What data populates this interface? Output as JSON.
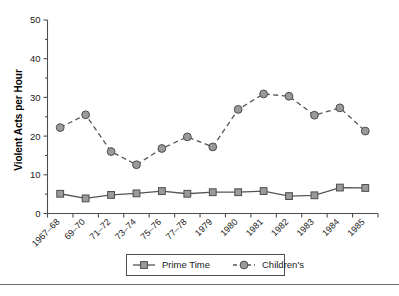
{
  "chart_data": {
    "type": "line",
    "title": "",
    "xlabel": "",
    "ylabel": "Violent Acts per Hour",
    "ylim": [
      0,
      50
    ],
    "yticks": [
      0,
      10,
      20,
      30,
      40,
      50
    ],
    "ytick_labels": [
      "0",
      "10",
      "20",
      "30",
      "40",
      "50"
    ],
    "minor_ytick_step": 5,
    "grid": false,
    "legend_position": "bottom-center",
    "categories": [
      "1967–68",
      "69–70",
      "71–72",
      "73–74",
      "75–76",
      "77–78",
      "1979",
      "1980",
      "1981",
      "1982",
      "1983",
      "1984",
      "1985"
    ],
    "series": [
      {
        "name": "Prime Time",
        "marker": "square",
        "linestyle": "solid",
        "color": "#555555",
        "marker_fill": "#9a9a9a",
        "values": [
          5.1,
          3.9,
          4.8,
          5.2,
          5.8,
          5.1,
          5.5,
          5.5,
          5.8,
          4.5,
          4.7,
          6.7,
          6.6
        ]
      },
      {
        "name": "Children's",
        "marker": "circle",
        "linestyle": "dashed",
        "color": "#555555",
        "marker_fill": "#9a9a9a",
        "values": [
          22.2,
          25.5,
          16.0,
          12.6,
          16.8,
          19.8,
          17.2,
          26.9,
          30.9,
          30.3,
          25.4,
          27.3,
          21.3
        ]
      }
    ]
  },
  "legend": {
    "entries": [
      {
        "label": "Prime Time",
        "marker": "square-marker",
        "linestyle": "solid"
      },
      {
        "label": "Children's",
        "marker": "circle-marker",
        "linestyle": "dashed"
      }
    ]
  },
  "colors": {
    "line": "#555555",
    "marker_fill": "#9a9a9a",
    "marker_edge": "#4d4d4d",
    "axis": "#4d4d4d",
    "text": "#1a1a1a",
    "rule": "#6a6a6a",
    "background": "#ffffff"
  }
}
